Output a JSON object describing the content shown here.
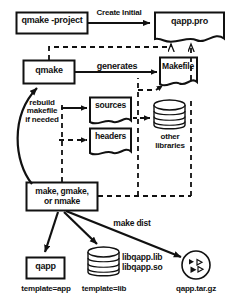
{
  "diagram": {
    "colors": {
      "stroke": "#111111",
      "fill": "#ffffff",
      "text": "#111111"
    },
    "nodes": [
      {
        "id": "qmake-project",
        "label": "qmake -project",
        "shape": "rect"
      },
      {
        "id": "qapp-pro",
        "label": "qapp.pro",
        "shape": "document"
      },
      {
        "id": "qmake",
        "label": "qmake",
        "shape": "rect"
      },
      {
        "id": "makefile",
        "label": "Makefile",
        "shape": "document"
      },
      {
        "id": "sources",
        "label": "sources",
        "shape": "document"
      },
      {
        "id": "headers",
        "label": "headers",
        "shape": "document"
      },
      {
        "id": "other-libraries",
        "label": "other\nlibraries",
        "shape": "cylinder"
      },
      {
        "id": "make-gmake-nmake",
        "label": "make, gmake,\nor nmake",
        "shape": "rect"
      },
      {
        "id": "qapp",
        "label": "qapp",
        "shape": "rect"
      },
      {
        "id": "libqapp",
        "label": "libqapp.lib\nlibqapp.so",
        "shape": "cylinder"
      },
      {
        "id": "qapp-targz",
        "label": "qapp.tar.gz",
        "shape": "circle-archive"
      }
    ],
    "edge_labels": {
      "create_initial": "Create Initial",
      "generates": "generates",
      "rebuild_makefile": "rebuild\nmakefile\nif needed",
      "make_dist": "make dist"
    },
    "captions": {
      "template_app": "template=app",
      "template_lib": "template=lib",
      "targz": "qapp.tar.gz"
    },
    "node_text": {
      "qmake_project": "qmake -project",
      "qapp_pro": "qapp.pro",
      "qmake": "qmake",
      "makefile": "Makefile",
      "sources": "sources",
      "headers": "headers",
      "other_libraries_l1": "other",
      "other_libraries_l2": "libraries",
      "make_l1": "make, gmake,",
      "make_l2": "or nmake",
      "qapp": "qapp",
      "lib_l1": "libqapp.lib",
      "lib_l2": "libqapp.so"
    }
  }
}
